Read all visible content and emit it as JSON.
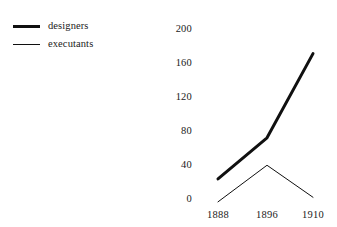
{
  "chart_data": {
    "type": "line",
    "title": "",
    "xlabel": "",
    "ylabel": "",
    "categories": [
      "1888",
      "1896",
      "1910"
    ],
    "series": [
      {
        "name": "designers",
        "values": [
          35,
          80,
          172
        ],
        "style": "thick",
        "color": "#101010"
      },
      {
        "name": "executants",
        "values": [
          10,
          50,
          15
        ],
        "style": "thin",
        "color": "#101010"
      }
    ],
    "yticks": [
      0,
      40,
      80,
      120,
      160,
      200
    ],
    "ylim": [
      0,
      200
    ],
    "grid": false,
    "axis_lines": false,
    "legend_position": "top-left",
    "background": "#ffffff"
  },
  "legend": {
    "items": [
      {
        "label": "designers"
      },
      {
        "label": "executants"
      }
    ]
  },
  "axes": {
    "y": {
      "labels": [
        "200",
        "160",
        "120",
        "80",
        "40",
        "0"
      ]
    },
    "x": {
      "labels": [
        "1888",
        "1896",
        "1910"
      ]
    }
  }
}
